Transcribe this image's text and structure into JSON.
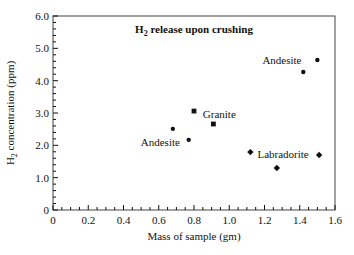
{
  "chart_data": {
    "type": "scatter",
    "title": "H2 release upon crushing",
    "title_main": "H",
    "title_sub": "2",
    "title_rest": " release upon crushing",
    "xlabel": "Mass of sample (gm)",
    "ylabel": "H2 concentration (ppm)",
    "ylabel_main": "H",
    "ylabel_sub": "2",
    "ylabel_rest": " concentration (ppm)",
    "xlim": [
      0,
      1.6
    ],
    "ylim": [
      0,
      6.0
    ],
    "x_ticks": [
      0,
      0.2,
      0.4,
      0.6,
      0.8,
      1.0,
      1.2,
      1.4,
      1.6
    ],
    "x_tick_labels": [
      "0",
      "0.2",
      "0.4",
      "0.6",
      "0.8",
      "1.0",
      "1.2",
      "1.4",
      "1.6"
    ],
    "y_ticks": [
      0,
      1.0,
      2.0,
      3.0,
      4.0,
      5.0,
      6.0
    ],
    "y_tick_labels": [
      "0",
      "1.0",
      "2.0",
      "3.0",
      "4.0",
      "5.0",
      "6.0"
    ],
    "grid": false,
    "legend": "none (inline point labels)",
    "series": [
      {
        "name": "Andesite",
        "marker": "circle",
        "points": [
          {
            "x": 1.5,
            "y": 4.64
          },
          {
            "x": 1.42,
            "y": 4.27
          }
        ],
        "label": {
          "text": "Andesite",
          "x": 1.41,
          "y": 4.64,
          "anchor": "end"
        }
      },
      {
        "name": "Andesite",
        "marker": "circle",
        "points": [
          {
            "x": 0.68,
            "y": 2.51
          },
          {
            "x": 0.77,
            "y": 2.17
          }
        ],
        "label": {
          "text": "Andesite",
          "x": 0.72,
          "y": 2.1,
          "anchor": "end"
        }
      },
      {
        "name": "Granite",
        "marker": "square",
        "points": [
          {
            "x": 0.8,
            "y": 3.06
          },
          {
            "x": 0.91,
            "y": 2.66
          }
        ],
        "label": {
          "text": "Granite",
          "x": 0.85,
          "y": 2.98,
          "anchor": "start"
        }
      },
      {
        "name": "Labradorite",
        "marker": "diamond",
        "points": [
          {
            "x": 1.12,
            "y": 1.79
          },
          {
            "x": 1.51,
            "y": 1.7
          },
          {
            "x": 1.27,
            "y": 1.3
          }
        ],
        "label": {
          "text": "Labradorite",
          "x": 1.16,
          "y": 1.72,
          "anchor": "start"
        }
      }
    ]
  },
  "layout": {
    "plot_left": 53,
    "plot_top": 16,
    "plot_right": 335,
    "plot_bottom": 210,
    "ink_color": "#111111",
    "frame_color": "#444444"
  }
}
